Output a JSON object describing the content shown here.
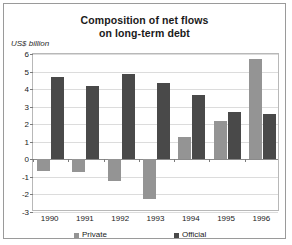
{
  "chart_data": {
    "type": "bar",
    "title": "Composition of net flows on long-term debt",
    "title_line1": "Composition of net flows",
    "title_line2": "on long-term debt",
    "xlabel": "",
    "ylabel": "US$ billion",
    "ylim": [
      -3,
      6
    ],
    "ytick_step": 1,
    "yticks": [
      6,
      5,
      4,
      3,
      2,
      1,
      0,
      -1,
      -2,
      -3
    ],
    "ytick_labels": [
      "6",
      "5",
      "4",
      "3",
      "2",
      "1",
      "0",
      "-1",
      "-2",
      "-3"
    ],
    "grid": true,
    "legend_position": "bottom",
    "categories": [
      "1990",
      "1991",
      "1992",
      "1993",
      "1994",
      "1995",
      "1996"
    ],
    "series": [
      {
        "name": "Private",
        "color": "#949494",
        "values": [
          -0.65,
          -0.75,
          -1.25,
          -2.25,
          1.3,
          2.2,
          5.7
        ]
      },
      {
        "name": "Official",
        "color": "#494949",
        "values": [
          4.7,
          4.2,
          4.85,
          4.35,
          3.65,
          2.7,
          2.6
        ]
      }
    ]
  },
  "legend": {
    "items": [
      {
        "label": "Private",
        "color": "#949494"
      },
      {
        "label": "Official",
        "color": "#494949"
      }
    ]
  },
  "colors": {
    "private": "#949494",
    "official": "#494949",
    "frame": "#9a9a9a",
    "gridline": "#dcdcdc",
    "axis": "#8a8a8a",
    "text": "#1a1a1a"
  }
}
